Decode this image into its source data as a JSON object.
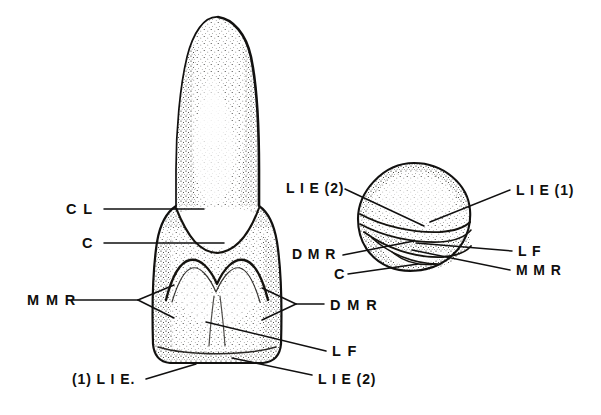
{
  "figure": {
    "background_color": "#ffffff",
    "ink_color": "#111010",
    "views": [
      {
        "name": "lateral-view",
        "description": "Elongated conical tooth shown in lateral (side) aspect, stippled shading, crown above and labelled basal ridge region below"
      },
      {
        "name": "occlusal-view",
        "description": "Rounded occlusal (top) aspect of the same tooth, stippled, showing ridges and fossa"
      }
    ]
  },
  "labels": {
    "lateral": [
      {
        "id": "cl",
        "text": "C L",
        "x": 66,
        "y": 214
      },
      {
        "id": "c",
        "text": "C",
        "x": 82,
        "y": 248
      },
      {
        "id": "mmr",
        "text": "M M R",
        "x": 27,
        "y": 305
      },
      {
        "id": "lie1",
        "text": "(1) L I E.",
        "x": 72,
        "y": 384
      },
      {
        "id": "dmr",
        "text": "D M R",
        "x": 330,
        "y": 310
      },
      {
        "id": "lf",
        "text": "L F",
        "x": 332,
        "y": 356
      },
      {
        "id": "lie2",
        "text": "L I E (2)",
        "x": 318,
        "y": 384
      }
    ],
    "occlusal": [
      {
        "id": "o-lie2",
        "text": "L I E (2)",
        "x": 286,
        "y": 193
      },
      {
        "id": "o-dmr",
        "text": "D M R",
        "x": 292,
        "y": 259
      },
      {
        "id": "o-c",
        "text": "C",
        "x": 334,
        "y": 279
      },
      {
        "id": "o-lie1",
        "text": "L I E (1)",
        "x": 516,
        "y": 195
      },
      {
        "id": "o-lf",
        "text": "L F",
        "x": 518,
        "y": 256
      },
      {
        "id": "o-mmr",
        "text": "M M R",
        "x": 516,
        "y": 275
      }
    ]
  },
  "legend_keys": {
    "CL": "CL",
    "C": "C",
    "MMR": "MMR",
    "DMR": "DMR",
    "LF": "LF",
    "LIE1": "LIE (1)",
    "LIE2": "LIE (2)"
  }
}
